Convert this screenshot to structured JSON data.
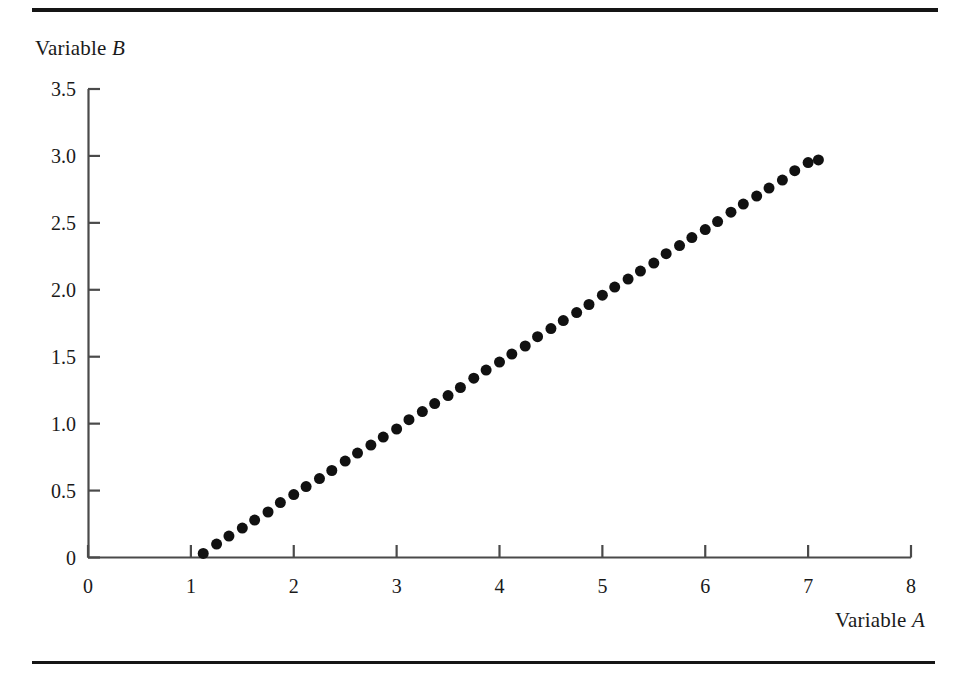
{
  "figure": {
    "top_rule": "horizontal-rule",
    "bottom_rule": "horizontal-rule",
    "background_color": "#ffffff",
    "ink_color": "#151515"
  },
  "labels": {
    "y_axis_title_prefix": "Variable ",
    "y_axis_title_variable": "B",
    "x_axis_title_prefix": "Variable ",
    "x_axis_title_variable": "A"
  },
  "chart_data": {
    "type": "scatter",
    "title": "",
    "xlabel": "Variable A",
    "ylabel": "Variable B",
    "xlim": [
      0,
      8
    ],
    "ylim": [
      0,
      3.5
    ],
    "xticks": [
      0,
      1,
      2,
      3,
      4,
      5,
      6,
      7,
      8
    ],
    "xtick_labels": [
      "0",
      "1",
      "2",
      "3",
      "4",
      "5",
      "6",
      "7",
      "8"
    ],
    "yticks": [
      0,
      0.5,
      1.0,
      1.5,
      2.0,
      2.5,
      3.0,
      3.5
    ],
    "ytick_labels": [
      "0",
      "0.5",
      "1.0",
      "1.5",
      "2.0",
      "2.5",
      "3.0",
      "3.5"
    ],
    "grid": false,
    "legend": null,
    "marker": {
      "shape": "circle",
      "color": "#111111",
      "size_px": 11
    },
    "relationship": "B = 0.5 (A - 1)",
    "series": [
      {
        "name": "data",
        "x": [
          1.12,
          1.25,
          1.37,
          1.5,
          1.62,
          1.75,
          1.87,
          2.0,
          2.12,
          2.25,
          2.37,
          2.5,
          2.62,
          2.75,
          2.87,
          3.0,
          3.12,
          3.25,
          3.37,
          3.5,
          3.62,
          3.75,
          3.87,
          4.0,
          4.12,
          4.25,
          4.37,
          4.5,
          4.62,
          4.75,
          4.87,
          5.0,
          5.12,
          5.25,
          5.37,
          5.5,
          5.62,
          5.75,
          5.87,
          6.0,
          6.12,
          6.25,
          6.37,
          6.5,
          6.62,
          6.75,
          6.87,
          7.0,
          7.1
        ],
        "y": [
          0.03,
          0.1,
          0.16,
          0.22,
          0.28,
          0.34,
          0.41,
          0.47,
          0.53,
          0.59,
          0.65,
          0.72,
          0.78,
          0.84,
          0.9,
          0.96,
          1.03,
          1.09,
          1.15,
          1.21,
          1.27,
          1.34,
          1.4,
          1.46,
          1.52,
          1.58,
          1.65,
          1.71,
          1.77,
          1.83,
          1.89,
          1.96,
          2.02,
          2.08,
          2.14,
          2.2,
          2.27,
          2.33,
          2.39,
          2.45,
          2.51,
          2.58,
          2.64,
          2.7,
          2.76,
          2.82,
          2.89,
          2.95,
          2.97
        ]
      }
    ]
  }
}
